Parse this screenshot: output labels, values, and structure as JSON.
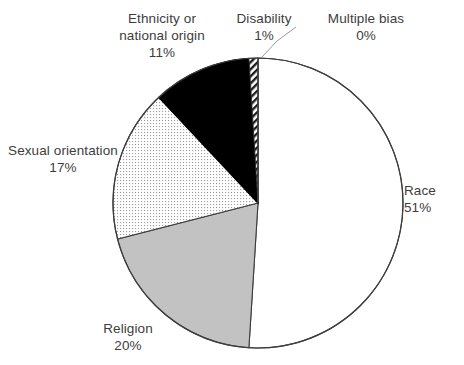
{
  "chart_data": {
    "type": "pie",
    "title": "",
    "subtitle": "",
    "xlabel": "",
    "ylabel": "",
    "legend_position": "none",
    "grid": false,
    "labels_outside": true,
    "start_angle_deg": 0,
    "direction": "clockwise",
    "categories": [
      "Race",
      "Religion",
      "Sexual orientation",
      "Ethnicity or national origin",
      "Disability",
      "Multiple bias"
    ],
    "values": [
      51,
      20,
      17,
      11,
      1,
      0
    ],
    "value_unit": "%",
    "slices": [
      {
        "name": "Race",
        "value": 51,
        "value_text": "51%",
        "fill": "#ffffff",
        "pattern": "solid",
        "stroke": "#3d3d3d"
      },
      {
        "name": "Religion",
        "value": 20,
        "value_text": "20%",
        "fill": "#c2c2c2",
        "pattern": "solid",
        "stroke": "#3d3d3d"
      },
      {
        "name": "Sexual orientation",
        "value": 17,
        "value_text": "17%",
        "fill": "#fdfdfd",
        "pattern": "dotted",
        "stroke": "#3d3d3d"
      },
      {
        "name": "Ethnicity or national origin",
        "value": 11,
        "value_text": "11%",
        "fill": "#000000",
        "pattern": "solid",
        "stroke": "#000000"
      },
      {
        "name": "Disability",
        "value": 1,
        "value_text": "1%",
        "fill": "#ffffff",
        "pattern": "diagonal-hatch",
        "stroke": "#2b2b2b"
      },
      {
        "name": "Multiple bias",
        "value": 0,
        "value_text": "0%",
        "fill": "#ffffff",
        "pattern": "none",
        "stroke": "#3d3d3d"
      }
    ]
  },
  "labels": {
    "ethnicity": {
      "line1": "Ethnicity or",
      "line2": "national origin",
      "value": "11%"
    },
    "disability": {
      "line1": "Disability",
      "value": "1%"
    },
    "multiple_bias": {
      "line1": "Multiple bias",
      "value": "0%"
    },
    "race": {
      "line1": "Race",
      "value": "51%"
    },
    "sexual_orientation": {
      "line1": "Sexual orientation",
      "value": "17%"
    },
    "religion": {
      "line1": "Religion",
      "value": "20%"
    }
  },
  "colors": {
    "text": "#3d3d3d",
    "outline": "#3d3d3d",
    "leader_line": "#9a9a9a",
    "gray_slice": "#c2c2c2",
    "black_slice": "#000000",
    "background": "#ffffff"
  }
}
